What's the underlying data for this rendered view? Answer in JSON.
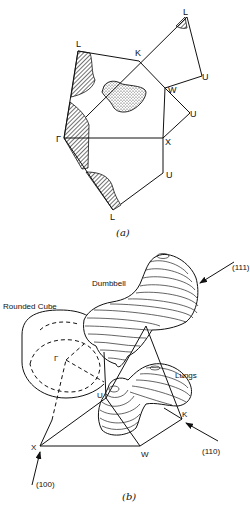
{
  "panel_a": {
    "caption": "(a)",
    "points": {
      "L_top": "L",
      "L_left": "L",
      "K": "K",
      "U_top": "U",
      "W": "W",
      "U_mid": "U",
      "Gamma": "Γ",
      "X": "X",
      "U_low": "U",
      "L_bottom": "L"
    },
    "regions": [
      "hatched-fermi-section",
      "stippled-fermi-section"
    ]
  },
  "panel_b": {
    "caption": "(b)",
    "shapes": {
      "dumbbell": "Dumbbell",
      "rounded_cube": "Rounded Cube",
      "lungs": "Lungs"
    },
    "points": {
      "Gamma": "Γ",
      "U": "U",
      "K": "K",
      "X": "X",
      "W": "W"
    },
    "directions": {
      "d111": "(111)",
      "d110": "(110)",
      "d100": "(100)"
    }
  },
  "colors": {
    "ink": "#111111",
    "background": "#ffffff"
  }
}
